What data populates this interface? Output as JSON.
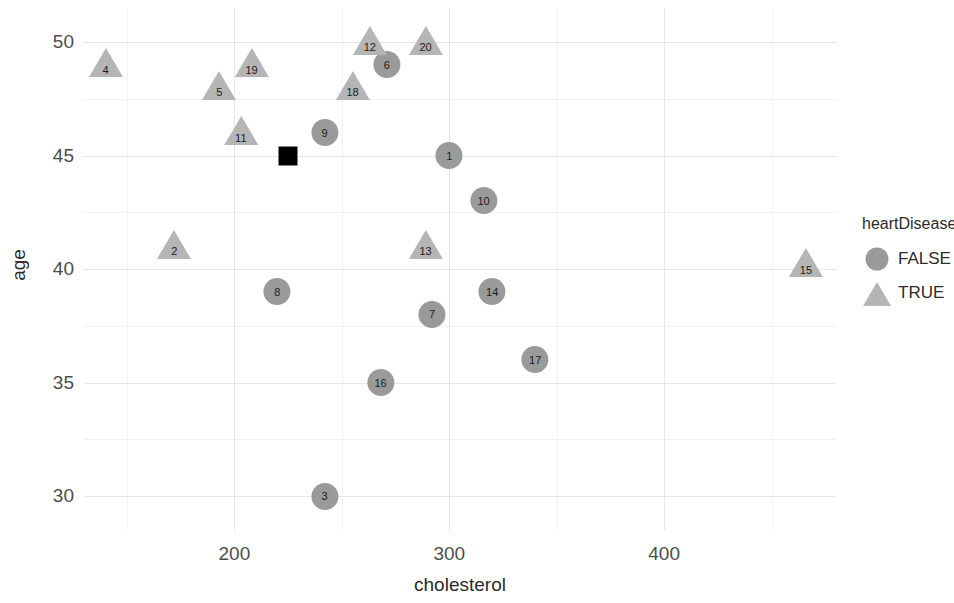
{
  "chart_data": {
    "type": "scatter",
    "title": "",
    "xlabel": "cholesterol",
    "ylabel": "age",
    "xlim": [
      130,
      480
    ],
    "ylim": [
      28.5,
      51.5
    ],
    "grid": true,
    "x_ticks": [
      200,
      300,
      400
    ],
    "y_ticks": [
      30,
      35,
      40,
      45,
      50
    ],
    "x_minor_ticks": [
      150,
      250,
      350,
      450
    ],
    "y_minor_ticks": [
      32.5,
      37.5,
      42.5,
      47.5
    ],
    "legend": {
      "title": "heartDisease",
      "position": "right",
      "entries": [
        {
          "label": "FALSE",
          "marker": "circle",
          "color": "#9a9a9a"
        },
        {
          "label": "TRUE",
          "marker": "triangle",
          "color": "#b5b5b5"
        }
      ]
    },
    "series": [
      {
        "name": "FALSE",
        "marker": "circle",
        "color": "#9a9a9a",
        "points": [
          {
            "id": "1",
            "x": 300,
            "y": 45
          },
          {
            "id": "3",
            "x": 242,
            "y": 30
          },
          {
            "id": "6",
            "x": 271,
            "y": 49
          },
          {
            "id": "7",
            "x": 292,
            "y": 38
          },
          {
            "id": "8",
            "x": 220,
            "y": 39
          },
          {
            "id": "9",
            "x": 242,
            "y": 46
          },
          {
            "id": "10",
            "x": 316,
            "y": 43
          },
          {
            "id": "14",
            "x": 320,
            "y": 39
          },
          {
            "id": "16",
            "x": 268,
            "y": 35
          },
          {
            "id": "17",
            "x": 340,
            "y": 36
          }
        ]
      },
      {
        "name": "TRUE",
        "marker": "triangle",
        "color": "#b5b5b5",
        "points": [
          {
            "id": "2",
            "x": 172,
            "y": 41
          },
          {
            "id": "4",
            "x": 140,
            "y": 49
          },
          {
            "id": "5",
            "x": 193,
            "y": 48
          },
          {
            "id": "11",
            "x": 203,
            "y": 46
          },
          {
            "id": "12",
            "x": 263,
            "y": 50
          },
          {
            "id": "13",
            "x": 289,
            "y": 41
          },
          {
            "id": "15",
            "x": 466,
            "y": 40.2
          },
          {
            "id": "18",
            "x": 255,
            "y": 48
          },
          {
            "id": "19",
            "x": 208,
            "y": 49
          },
          {
            "id": "20",
            "x": 289,
            "y": 50
          }
        ]
      },
      {
        "name": "reference",
        "marker": "square",
        "color": "#000000",
        "points": [
          {
            "id": "",
            "x": 225,
            "y": 45
          }
        ]
      }
    ]
  }
}
